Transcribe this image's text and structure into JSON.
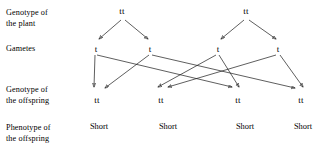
{
  "diagram": {
    "row_labels": [
      {
        "id": "genotype-plant",
        "text": "Genotype of\nthe plant",
        "y": 8
      },
      {
        "id": "gametes",
        "text": "Gametes",
        "y": 44
      },
      {
        "id": "genotype-offspring",
        "text": "Genotype of\nthe offspring",
        "y": 85
      },
      {
        "id": "phenotype-offspring",
        "text": "Phenotype of\nthe offspring",
        "y": 123
      }
    ],
    "parents": [
      {
        "id": "parent-1",
        "label": "tt",
        "x": 122,
        "y": 6
      },
      {
        "id": "parent-2",
        "label": "tt",
        "x": 246,
        "y": 6
      }
    ],
    "gametes": [
      {
        "id": "gamete-1",
        "label": "t",
        "x": 96,
        "y": 44
      },
      {
        "id": "gamete-2",
        "label": "t",
        "x": 150,
        "y": 44
      },
      {
        "id": "gamete-3",
        "label": "t",
        "x": 218,
        "y": 44
      },
      {
        "id": "gamete-4",
        "label": "t",
        "x": 278,
        "y": 44
      }
    ],
    "offspring": [
      {
        "id": "offspring-1",
        "label": "tt",
        "x": 97,
        "y": 95
      },
      {
        "id": "offspring-2",
        "label": "tt",
        "x": 161,
        "y": 95
      },
      {
        "id": "offspring-3",
        "label": "tt",
        "x": 238,
        "y": 95
      },
      {
        "id": "offspring-4",
        "label": "tt",
        "x": 301,
        "y": 95
      }
    ],
    "phenotypes": [
      {
        "id": "phenotype-1",
        "label": "Short",
        "x": 99,
        "y": 122
      },
      {
        "id": "phenotype-2",
        "label": "Short",
        "x": 168,
        "y": 122
      },
      {
        "id": "phenotype-3",
        "label": "Short",
        "x": 245,
        "y": 122
      },
      {
        "id": "phenotype-4",
        "label": "Short",
        "x": 303,
        "y": 122
      }
    ],
    "colors": {
      "line": "#1a1a1a",
      "text": "#000000",
      "background": "#ffffff"
    }
  }
}
